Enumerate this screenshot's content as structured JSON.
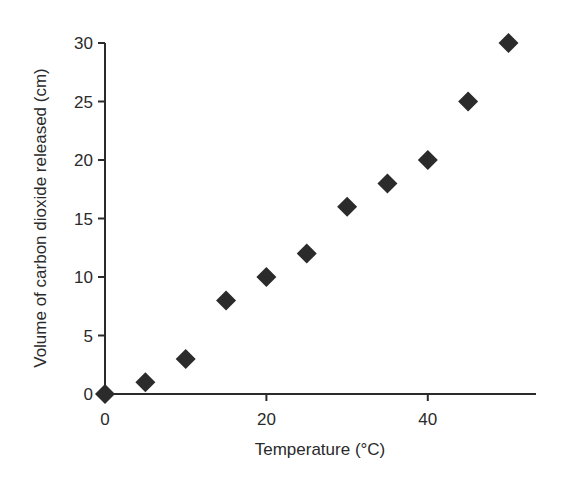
{
  "chart_data": {
    "type": "scatter",
    "title": "",
    "xlabel": "Temperature (°C)",
    "ylabel": "Volume of carbon dioxide released (cm)",
    "x_ticks": [
      0,
      20,
      40
    ],
    "y_ticks": [
      0,
      5,
      10,
      15,
      20,
      25,
      30
    ],
    "xlim": [
      0,
      53
    ],
    "ylim": [
      0,
      30
    ],
    "grid": false,
    "legend": null,
    "marker": "diamond",
    "marker_color": "#2b2b2b",
    "series": [
      {
        "name": "CO2 volume",
        "x": [
          0,
          5,
          10,
          15,
          20,
          25,
          30,
          35,
          40,
          45,
          50
        ],
        "y": [
          0,
          1,
          3,
          8,
          10,
          12,
          16,
          18,
          20,
          25,
          30
        ]
      }
    ]
  },
  "layout": {
    "origin_px": [
      105,
      394
    ],
    "x_px_per_unit": 8.07,
    "y_px_per_unit": 11.7,
    "x_axis_end_px": 536,
    "y_axis_top_px": 43
  }
}
